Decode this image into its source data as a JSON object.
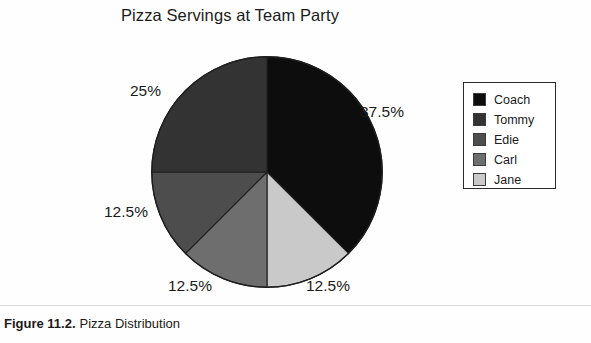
{
  "chart_data": {
    "type": "pie",
    "title": "Pizza Servings at Team Party",
    "categories": [
      "Coach",
      "Tommy",
      "Edie",
      "Carl",
      "Jane"
    ],
    "values": [
      37.5,
      25,
      12.5,
      12.5,
      12.5
    ],
    "value_labels": [
      "37.5%",
      "25%",
      "12.5%",
      "12.5%",
      "12.5%"
    ],
    "units": "percent",
    "start_angle_deg": 0,
    "direction": "clockwise",
    "legend_position": "right",
    "grid": false,
    "slice_colors": [
      "#0d0d0d",
      "#333333",
      "#4d4d4d",
      "#6e6e6e",
      "#c9c9c9"
    ],
    "slice_order_clockwise_from_top": [
      "Coach",
      "Jane",
      "Carl",
      "Edie",
      "Tommy"
    ],
    "slices": [
      {
        "name": "Coach",
        "value": 37.5,
        "label": "37.5%",
        "color": "#0d0d0d",
        "start_deg": 0,
        "end_deg": 135
      },
      {
        "name": "Jane",
        "value": 12.5,
        "label": "12.5%",
        "color": "#c9c9c9",
        "start_deg": 135,
        "end_deg": 180
      },
      {
        "name": "Carl",
        "value": 12.5,
        "label": "12.5%",
        "color": "#6e6e6e",
        "start_deg": 180,
        "end_deg": 225
      },
      {
        "name": "Edie",
        "value": 12.5,
        "label": "12.5%",
        "color": "#4d4d4d",
        "start_deg": 225,
        "end_deg": 270
      },
      {
        "name": "Tommy",
        "value": 25.0,
        "label": "25%",
        "color": "#333333",
        "start_deg": 270,
        "end_deg": 360
      }
    ]
  },
  "chart": {
    "title": "Pizza Servings at Team Party",
    "labels": {
      "coach": "37.5%",
      "jane": "12.5%",
      "carl": "12.5%",
      "edie": "12.5%",
      "tommy": "25%"
    }
  },
  "legend": {
    "items": [
      {
        "label": "Coach",
        "color": "#0d0d0d"
      },
      {
        "label": "Tommy",
        "color": "#333333"
      },
      {
        "label": "Edie",
        "color": "#4d4d4d"
      },
      {
        "label": "Carl",
        "color": "#6e6e6e"
      },
      {
        "label": "Jane",
        "color": "#c9c9c9"
      }
    ]
  },
  "caption": {
    "figure_number": "Figure 11.2.",
    "text": "Pizza Distribution"
  }
}
